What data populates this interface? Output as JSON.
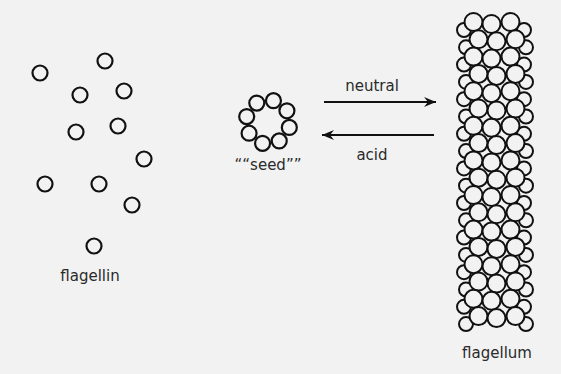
{
  "labels": {
    "monomer": "flagellin",
    "seed": "““seed””",
    "forward": "neutral",
    "reverse": "acid",
    "polymer": "flagellum"
  },
  "colors": {
    "background": "#f2f2f2",
    "stroke": "#111111",
    "text": "#2a2a2a"
  },
  "monomers": [
    [
      40,
      73
    ],
    [
      105,
      61
    ],
    [
      80,
      95
    ],
    [
      124,
      91
    ],
    [
      76,
      132
    ],
    [
      118,
      126
    ],
    [
      144,
      159
    ],
    [
      45,
      184
    ],
    [
      99,
      184
    ],
    [
      132,
      205
    ],
    [
      94,
      246
    ]
  ],
  "seed": {
    "cx": 268,
    "cy": 122,
    "ring_radius": 22,
    "count": 8,
    "circle_r": 7.5
  },
  "arrows": [
    {
      "name": "neutral-arrow",
      "x1": 324,
      "y1": 102,
      "x2": 436,
      "y2": 102,
      "dir": "right"
    },
    {
      "name": "acid-arrow",
      "x1": 434,
      "y1": 135,
      "x2": 322,
      "y2": 135,
      "dir": "left"
    }
  ],
  "flagellum": {
    "top": 22,
    "rows": 18,
    "row_step": 17.3,
    "circle_r": 9
  }
}
